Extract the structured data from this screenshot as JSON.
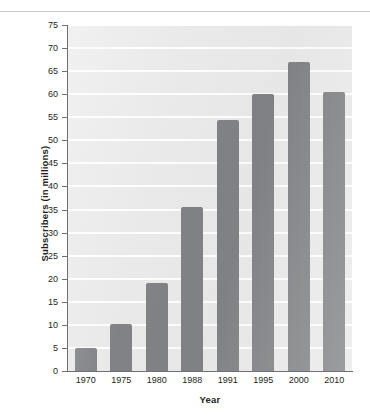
{
  "chart_data": {
    "type": "bar",
    "title": "",
    "xlabel": "Year",
    "ylabel": "Subscribers (in millions)",
    "categories": [
      "1970",
      "1975",
      "1980",
      "1988",
      "1991",
      "1995",
      "2000",
      "2010"
    ],
    "values": [
      5,
      10.2,
      19,
      35.5,
      54.5,
      60,
      67,
      60.5
    ],
    "ylim": [
      0,
      75
    ],
    "yticks": [
      0,
      5,
      10,
      15,
      20,
      25,
      30,
      35,
      40,
      45,
      50,
      55,
      60,
      65,
      70,
      75
    ],
    "ytick_labels": [
      "0",
      "5",
      "10",
      "15",
      "20",
      "25",
      "30",
      "35",
      "40",
      "45",
      "50",
      "55",
      "60",
      "65",
      "70",
      "75"
    ],
    "grid": true,
    "grid_axis": "y",
    "legend": false,
    "series": [
      {
        "name": "Subscribers",
        "values": [
          5,
          10.2,
          19,
          35.5,
          54.5,
          60,
          67,
          60.5
        ]
      }
    ]
  },
  "style": {
    "bar_color": "#808285",
    "panel_background": "#e9e9e9",
    "gridline_color": "#fdfdfd",
    "axis_color": "#6e7174",
    "text_color": "#231f20",
    "rule_color": "#c9ccce",
    "page_background": "#ffffff"
  }
}
